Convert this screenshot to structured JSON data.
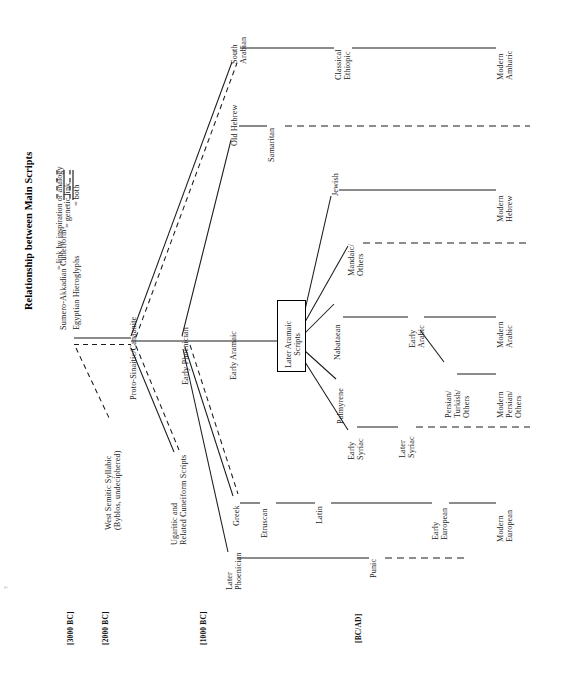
{
  "figure": {
    "title": "Relationship between Main Scripts",
    "orientation": "rotated-90-ccw",
    "background": "#ffffff",
    "ink_color": "#1b1b1b"
  },
  "legend": {
    "items": [
      {
        "key": "inspiration",
        "style": "dashed",
        "label": "= link by inspiration or analogy"
      },
      {
        "key": "genetic",
        "style": "solid",
        "label": "= genetic link"
      },
      {
        "key": "both",
        "style": "double-dashed",
        "label": "= both"
      }
    ]
  },
  "timeline": {
    "markers": [
      {
        "id": "m3000",
        "label": "[3000 BC]",
        "small_caps": "BC"
      },
      {
        "id": "m2000",
        "label": "[2000 BC]",
        "small_caps": "BC"
      },
      {
        "id": "m1000",
        "label": "[1000 BC]",
        "small_caps": "BC"
      },
      {
        "id": "mbcad",
        "label": "[BC/AD]",
        "small_caps": "BC/AD"
      }
    ]
  },
  "nodes": [
    {
      "id": "sumero",
      "label": "Sumero-Akkadian Cuneiform",
      "lines": [
        "Sumero-Akkadian Cuneiform"
      ]
    },
    {
      "id": "egyptian",
      "label": "Egyptian Hieroglyphs",
      "lines": [
        "Egyptian Hieroglyphs"
      ]
    },
    {
      "id": "westsemitic",
      "label": "West Semitic Syllabic (Byblos, undeciphered)",
      "lines": [
        "West Semitic Syllabic",
        "(Byblos, undeciphered)"
      ]
    },
    {
      "id": "protosinaitic",
      "label": "Proto-Sinaitic/Canaanite",
      "lines": [
        "Proto-Sinaitic/Canaanite"
      ]
    },
    {
      "id": "ugaritic",
      "label": "Ugaritic and Related Cuneiform Scripts",
      "lines": [
        "Ugaritic and",
        "Related Cuneiform Scripts"
      ]
    },
    {
      "id": "southarabian",
      "label": "South Arabian",
      "lines": [
        "South",
        "Arabian"
      ]
    },
    {
      "id": "classethiopic",
      "label": "Classical Ethiopic",
      "lines": [
        "Classical",
        "Ethiopic"
      ]
    },
    {
      "id": "modamharic",
      "label": "Modern Amharic",
      "lines": [
        "Modern",
        "Amharic"
      ]
    },
    {
      "id": "oldhebrew",
      "label": "Old Hebrew",
      "lines": [
        "Old Hebrew"
      ]
    },
    {
      "id": "samaritan",
      "label": "Samaritan",
      "lines": [
        "Samaritan"
      ]
    },
    {
      "id": "earlyphoen",
      "label": "Early Phoenician",
      "lines": [
        "Early Phoenician"
      ]
    },
    {
      "id": "earlyaramaic",
      "label": "Early Aramaic",
      "lines": [
        "Early Aramaic"
      ]
    },
    {
      "id": "lateraramaic",
      "label": "Later Aramaic Scripts",
      "lines": [
        "Later Aramaic",
        "Scripts"
      ],
      "boxed": true
    },
    {
      "id": "jewish",
      "label": "Jewish",
      "lines": [
        "Jewish"
      ]
    },
    {
      "id": "modhebrew",
      "label": "Modern Hebrew",
      "lines": [
        "Modern",
        "Hebrew"
      ]
    },
    {
      "id": "mandaic",
      "label": "Mandaic/Others",
      "lines": [
        "Mandaic/",
        "Others"
      ]
    },
    {
      "id": "nabataean",
      "label": "Nabataean",
      "lines": [
        "Nabataean"
      ]
    },
    {
      "id": "earlyarabic",
      "label": "Early Arabic",
      "lines": [
        "Early",
        "Arabic"
      ]
    },
    {
      "id": "modarabic",
      "label": "Modern Arabic",
      "lines": [
        "Modern",
        "Arabic"
      ]
    },
    {
      "id": "persianturk",
      "label": "Persian/Turkish/Others",
      "lines": [
        "Persian/",
        "Turkish/",
        "Others"
      ]
    },
    {
      "id": "modpersian",
      "label": "Modern Persian/Others",
      "lines": [
        "Modern",
        "Persian/",
        "Others"
      ]
    },
    {
      "id": "palmyrene",
      "label": "Palmyrene",
      "lines": [
        "Palmyrene"
      ]
    },
    {
      "id": "earlysyriac",
      "label": "Early Syriac",
      "lines": [
        "Early",
        "Syriac"
      ]
    },
    {
      "id": "latersyriac",
      "label": "Later Syriac",
      "lines": [
        "Later",
        "Syriac"
      ]
    },
    {
      "id": "greek",
      "label": "Greek",
      "lines": [
        "Greek"
      ]
    },
    {
      "id": "etruscan",
      "label": "Etruscan",
      "lines": [
        "Etruscan"
      ]
    },
    {
      "id": "latin",
      "label": "Latin",
      "lines": [
        "Latin"
      ]
    },
    {
      "id": "earlyeuropean",
      "label": "Early European",
      "lines": [
        "Early",
        "European"
      ]
    },
    {
      "id": "modeuropean",
      "label": "Modern European",
      "lines": [
        "Modern",
        "European"
      ]
    },
    {
      "id": "laterphoen",
      "label": "Later Phoenician",
      "lines": [
        "Later",
        "Phoenician"
      ]
    },
    {
      "id": "punic",
      "label": "Punic",
      "lines": [
        "Punic"
      ]
    }
  ],
  "edges": [
    {
      "from": "egyptian",
      "to": "westsemitic",
      "style": "inspiration"
    },
    {
      "from": "egyptian",
      "to": "protosinaitic",
      "style": "both"
    },
    {
      "from": "protosinaitic",
      "to": "southarabian",
      "style": "both"
    },
    {
      "from": "protosinaitic",
      "to": "ugaritic",
      "style": "both"
    },
    {
      "from": "protosinaitic",
      "to": "earlyphoen",
      "style": "genetic"
    },
    {
      "from": "southarabian",
      "to": "classethiopic",
      "style": "genetic"
    },
    {
      "from": "classethiopic",
      "to": "modamharic",
      "style": "genetic"
    },
    {
      "from": "earlyphoen",
      "to": "oldhebrew",
      "style": "genetic"
    },
    {
      "from": "oldhebrew",
      "to": "samaritan",
      "style": "genetic"
    },
    {
      "from": "samaritan",
      "to": "present",
      "style": "inspiration"
    },
    {
      "from": "earlyphoen",
      "to": "earlyaramaic",
      "style": "genetic"
    },
    {
      "from": "earlyaramaic",
      "to": "lateraramaic",
      "style": "genetic"
    },
    {
      "from": "lateraramaic",
      "to": "jewish",
      "style": "genetic"
    },
    {
      "from": "jewish",
      "to": "modhebrew",
      "style": "genetic"
    },
    {
      "from": "lateraramaic",
      "to": "mandaic",
      "style": "genetic"
    },
    {
      "from": "mandaic",
      "to": "present",
      "style": "inspiration"
    },
    {
      "from": "lateraramaic",
      "to": "nabataean",
      "style": "genetic"
    },
    {
      "from": "nabataean",
      "to": "earlyarabic",
      "style": "genetic"
    },
    {
      "from": "earlyarabic",
      "to": "modarabic",
      "style": "genetic"
    },
    {
      "from": "earlyarabic",
      "to": "persianturk",
      "style": "genetic"
    },
    {
      "from": "persianturk",
      "to": "modpersian",
      "style": "genetic"
    },
    {
      "from": "lateraramaic",
      "to": "palmyrene",
      "style": "genetic"
    },
    {
      "from": "lateraramaic",
      "to": "earlysyriac",
      "style": "genetic"
    },
    {
      "from": "earlysyriac",
      "to": "latersyriac",
      "style": "genetic"
    },
    {
      "from": "latersyriac",
      "to": "present",
      "style": "inspiration"
    },
    {
      "from": "earlyphoen",
      "to": "greek",
      "style": "both"
    },
    {
      "from": "greek",
      "to": "etruscan",
      "style": "genetic"
    },
    {
      "from": "etruscan",
      "to": "latin",
      "style": "genetic"
    },
    {
      "from": "latin",
      "to": "earlyeuropean",
      "style": "genetic"
    },
    {
      "from": "earlyeuropean",
      "to": "modeuropean",
      "style": "genetic"
    },
    {
      "from": "earlyphoen",
      "to": "laterphoen",
      "style": "genetic"
    },
    {
      "from": "laterphoen",
      "to": "punic",
      "style": "genetic"
    },
    {
      "from": "punic",
      "to": "end",
      "style": "inspiration"
    }
  ]
}
